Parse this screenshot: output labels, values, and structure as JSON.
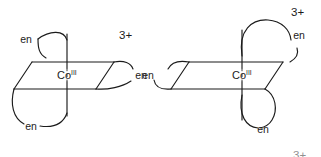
{
  "figure": {
    "background_color": "#ffffff",
    "line_color": "#1b1b1b",
    "text_color": "#1b1b1b",
    "width": 321,
    "height": 157
  },
  "structures": [
    {
      "id": "left-complex",
      "name": "delta-isomer",
      "metal": {
        "element": "Co",
        "oxidation_state": "III"
      },
      "charge": "3+",
      "ligands": [
        {
          "id": "left-en-upper",
          "label": "en",
          "position": "upper-left"
        },
        {
          "id": "left-en-lower",
          "label": "en",
          "position": "lower-left"
        },
        {
          "id": "left-en-right",
          "label": "en",
          "position": "right-edge"
        }
      ]
    },
    {
      "id": "right-complex",
      "name": "lambda-isomer",
      "metal": {
        "element": "Co",
        "oxidation_state": "III"
      },
      "charge": "3+",
      "ligands": [
        {
          "id": "right-en-top",
          "label": "en",
          "position": "top-right"
        },
        {
          "id": "right-en-left",
          "label": "en",
          "position": "left-edge"
        },
        {
          "id": "right-en-bottom",
          "label": "en",
          "position": "bottom-right"
        }
      ]
    }
  ],
  "clipped_charge": {
    "label": "3+",
    "note": "partially visible at bottom edge"
  }
}
